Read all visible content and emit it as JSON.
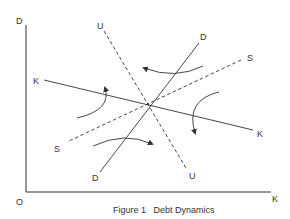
{
  "figure": {
    "caption": "Figure 1   Debt Dynamics",
    "axes": {
      "y_label": "D",
      "x_label": "K",
      "origin_label": "O"
    },
    "lines": [
      {
        "name": "K",
        "style": "solid",
        "label_start": "K",
        "label_end": "K"
      },
      {
        "name": "D",
        "style": "solid",
        "label_start": "D",
        "label_end": "D"
      },
      {
        "name": "U",
        "style": "dashed",
        "label_start": "U",
        "label_end": "U"
      },
      {
        "name": "S",
        "style": "dashed",
        "label_start": "S",
        "label_end": "S"
      }
    ],
    "flow_arrows": [
      {
        "region": "left",
        "direction": "up"
      },
      {
        "region": "top",
        "direction": "left"
      },
      {
        "region": "right",
        "direction": "down"
      },
      {
        "region": "bottom",
        "direction": "right"
      }
    ],
    "colors": {
      "ink": "#333333",
      "background": "#ffffff"
    }
  }
}
